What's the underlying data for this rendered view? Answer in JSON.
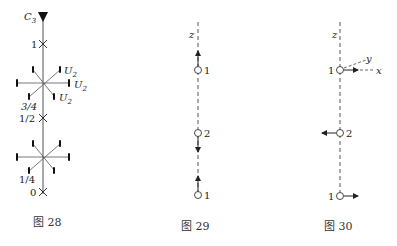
{
  "figures": [
    {
      "caption": "图 28",
      "axis_label": "C",
      "axis_sub": "3",
      "levels": [
        "1",
        "1/2",
        "0"
      ],
      "star_labels": [
        "3/4",
        "1/4"
      ],
      "u_label": "U",
      "u_sub": "2"
    },
    {
      "caption": "图 29",
      "axis_label": "z",
      "atoms": [
        "1",
        "2",
        "1"
      ]
    },
    {
      "caption": "图 30",
      "axis_label": "z",
      "atoms": [
        "1",
        "2",
        "1"
      ],
      "local_axes": [
        "x",
        "y"
      ]
    }
  ],
  "colors": {
    "line": "#444444",
    "text": "#222222"
  }
}
